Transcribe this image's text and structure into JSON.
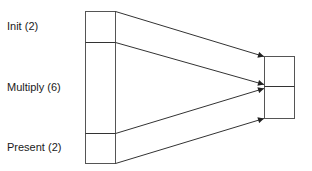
{
  "diagram": {
    "labels": [
      {
        "text": "Init (2)",
        "x": 7,
        "y": 20
      },
      {
        "text": "Multiply (6)",
        "x": 7,
        "y": 81
      },
      {
        "text": "Present (2)",
        "x": 7,
        "y": 141
      }
    ],
    "left_block": {
      "x": 85,
      "width": 30,
      "segments": [
        {
          "name": "Init",
          "count": 2,
          "top": 11,
          "bottom": 42
        },
        {
          "name": "Multiply",
          "count": 6,
          "top": 42,
          "bottom": 133
        },
        {
          "name": "Present",
          "count": 2,
          "top": 133,
          "bottom": 163
        }
      ]
    },
    "right_block": {
      "x": 264,
      "width": 30,
      "segments": [
        {
          "top": 56,
          "bottom": 86
        },
        {
          "top": 86,
          "bottom": 118
        }
      ]
    },
    "arrows": [
      {
        "from": [
          115,
          11
        ],
        "to": [
          264,
          56
        ]
      },
      {
        "from": [
          115,
          42
        ],
        "to": [
          264,
          84
        ]
      },
      {
        "from": [
          115,
          133
        ],
        "to": [
          264,
          88
        ]
      },
      {
        "from": [
          115,
          163
        ],
        "to": [
          264,
          118
        ]
      }
    ],
    "stroke_color": "#333333"
  }
}
